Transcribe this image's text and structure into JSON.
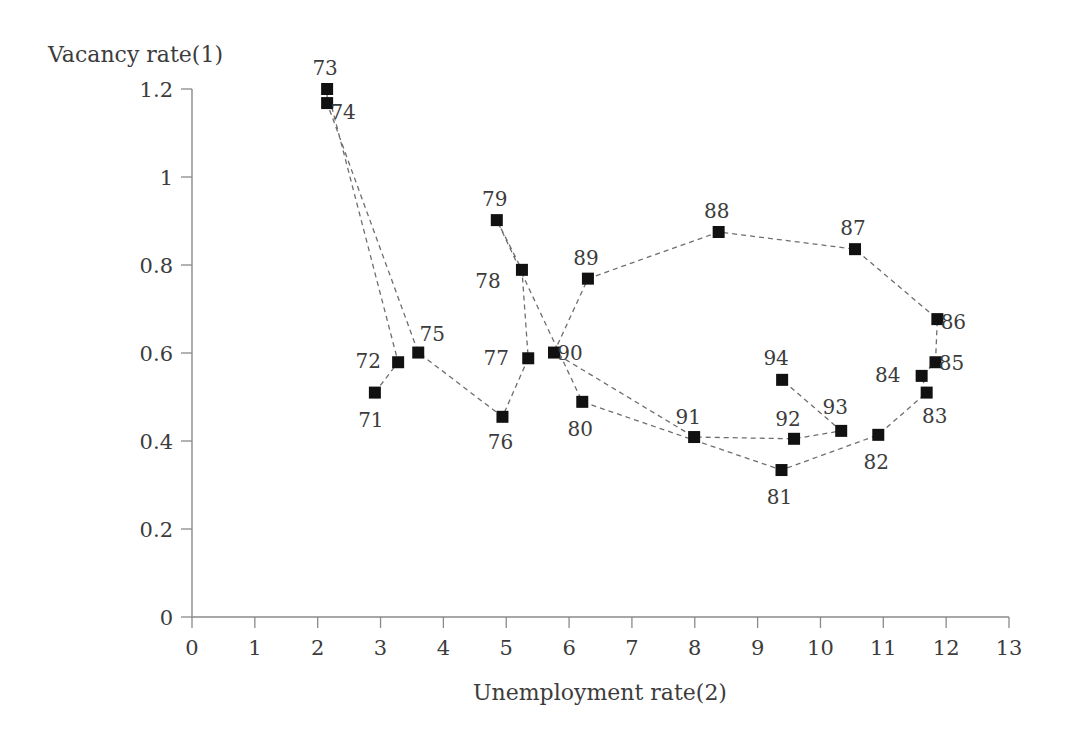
{
  "chart_data": {
    "type": "scatter",
    "title": "",
    "subtitle": "",
    "xlabel": "Unemployment rate(2)",
    "ylabel": "Vacancy rate(1)",
    "xlim": [
      0,
      13
    ],
    "ylim": [
      0,
      1.2
    ],
    "xticks": [
      "0",
      "1",
      "2",
      "3",
      "4",
      "5",
      "6",
      "7",
      "8",
      "9",
      "10",
      "11",
      "12",
      "13"
    ],
    "yticks": [
      "0",
      "0.2",
      "0.4",
      "0.6",
      "0.8",
      "1",
      "1.2"
    ],
    "grid": false,
    "legend": "none",
    "connected": true,
    "line_style": "dashed",
    "marker": "square",
    "marker_color": "#111111",
    "line_color": "#6e6e6e",
    "axis_color": "#8a8a8a",
    "background": "#ffffff",
    "points": [
      {
        "label": "71",
        "x": 2.91,
        "y": 0.51,
        "lx": -4,
        "ly": 34
      },
      {
        "label": "72",
        "x": 3.28,
        "y": 0.579,
        "lx": -30,
        "ly": 6
      },
      {
        "label": "73",
        "x": 2.15,
        "y": 1.2,
        "lx": -2,
        "ly": -14
      },
      {
        "label": "74",
        "x": 2.15,
        "y": 1.168,
        "lx": 16,
        "ly": 16
      },
      {
        "label": "75",
        "x": 3.6,
        "y": 0.601,
        "lx": 14,
        "ly": -12
      },
      {
        "label": "76",
        "x": 4.94,
        "y": 0.455,
        "lx": -2,
        "ly": 32
      },
      {
        "label": "77",
        "x": 5.35,
        "y": 0.588,
        "lx": -32,
        "ly": 7
      },
      {
        "label": "78",
        "x": 5.25,
        "y": 0.789,
        "lx": -34,
        "ly": 18
      },
      {
        "label": "79",
        "x": 4.85,
        "y": 0.902,
        "lx": -2,
        "ly": -14
      },
      {
        "label": "80",
        "x": 6.21,
        "y": 0.489,
        "lx": -2,
        "ly": 34
      },
      {
        "label": "81",
        "x": 9.38,
        "y": 0.334,
        "lx": -2,
        "ly": 34
      },
      {
        "label": "82",
        "x": 10.92,
        "y": 0.414,
        "lx": -2,
        "ly": 34
      },
      {
        "label": "83",
        "x": 11.69,
        "y": 0.51,
        "lx": 8,
        "ly": 30
      },
      {
        "label": "84",
        "x": 11.61,
        "y": 0.548,
        "lx": -34,
        "ly": 6
      },
      {
        "label": "85",
        "x": 11.83,
        "y": 0.579,
        "lx": 16,
        "ly": 8
      },
      {
        "label": "86",
        "x": 11.86,
        "y": 0.677,
        "lx": 16,
        "ly": 10
      },
      {
        "label": "87",
        "x": 10.55,
        "y": 0.836,
        "lx": -2,
        "ly": -14
      },
      {
        "label": "88",
        "x": 8.38,
        "y": 0.875,
        "lx": -2,
        "ly": -14
      },
      {
        "label": "89",
        "x": 6.3,
        "y": 0.769,
        "lx": -2,
        "ly": -14
      },
      {
        "label": "90",
        "x": 5.76,
        "y": 0.601,
        "lx": 16,
        "ly": 7
      },
      {
        "label": "91",
        "x": 7.99,
        "y": 0.409,
        "lx": -6,
        "ly": -13
      },
      {
        "label": "92",
        "x": 9.58,
        "y": 0.405,
        "lx": -6,
        "ly": -13
      },
      {
        "label": "93",
        "x": 10.33,
        "y": 0.423,
        "lx": -6,
        "ly": -17
      },
      {
        "label": "94",
        "x": 9.39,
        "y": 0.539,
        "lx": -6,
        "ly": -15
      }
    ]
  }
}
